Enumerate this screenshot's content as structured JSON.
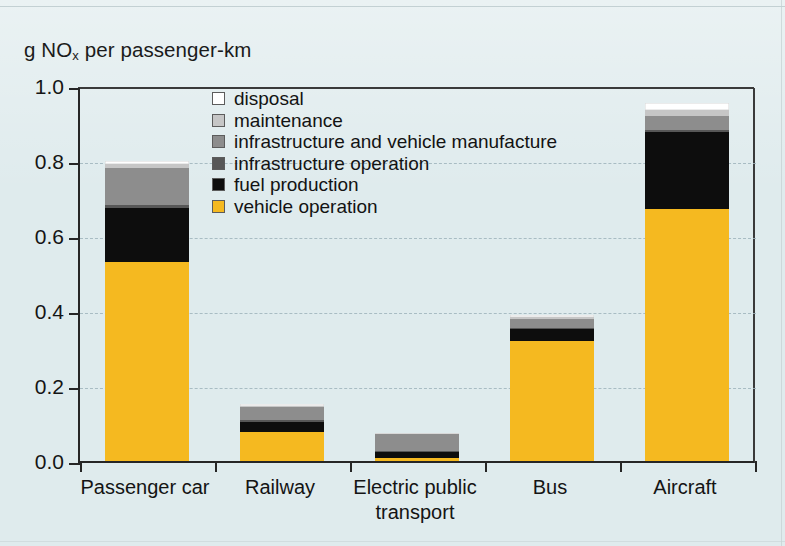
{
  "chart_data": {
    "type": "bar",
    "stacked": true,
    "title": "",
    "ylabel": "g NOx per passenger-km",
    "ylabel_html": "g NO<sub>x</sub> per passenger-km",
    "xlabel": "",
    "ylim": [
      0.0,
      1.0
    ],
    "yticks": [
      "1.0",
      "0.8",
      "0.6",
      "0.4",
      "0.2",
      "0.0"
    ],
    "ytick_values": [
      1.0,
      0.8,
      0.6,
      0.4,
      0.2,
      0.0
    ],
    "grid": "horizontal-dashed",
    "legend_position": "inside-top-left",
    "categories": [
      "Passenger car",
      "Railway",
      "Electric public transport",
      "Bus",
      "Aircraft"
    ],
    "category_lines": [
      [
        "Passenger car"
      ],
      [
        "Railway"
      ],
      [
        "Electric public",
        "transport"
      ],
      [
        "Bus"
      ],
      [
        "Aircraft"
      ]
    ],
    "series": [
      {
        "name": "vehicle operation",
        "color": "#f5b920",
        "values": [
          0.53,
          0.077,
          0.008,
          0.32,
          0.672
        ]
      },
      {
        "name": "fuel production",
        "color": "#0d0d0d",
        "values": [
          0.145,
          0.027,
          0.017,
          0.031,
          0.205
        ]
      },
      {
        "name": "infrastructure operation",
        "color": "#575757",
        "values": [
          0.007,
          0.005,
          0.003,
          0.004,
          0.006
        ]
      },
      {
        "name": "infrastructure and vehicle manufacture",
        "color": "#8d8d8d",
        "values": [
          0.1,
          0.035,
          0.043,
          0.025,
          0.037
        ]
      },
      {
        "name": "maintenance",
        "color": "#c6c6c6",
        "values": [
          0.01,
          0.004,
          0.002,
          0.005,
          0.016
        ]
      },
      {
        "name": "disposal",
        "color": "#ffffff",
        "values": [
          0.008,
          0.004,
          0.002,
          0.005,
          0.019
        ]
      }
    ],
    "totals": [
      0.8,
      0.152,
      0.075,
      0.39,
      0.955
    ]
  },
  "legend": {
    "items": [
      {
        "label": "disposal",
        "color": "#ffffff"
      },
      {
        "label": "maintenance",
        "color": "#c6c6c6"
      },
      {
        "label": "infrastructure and vehicle manufacture",
        "color": "#8d8d8d"
      },
      {
        "label": "infrastructure operation",
        "color": "#575757"
      },
      {
        "label": "fuel production",
        "color": "#0d0d0d"
      },
      {
        "label": "vehicle operation",
        "color": "#f5b920"
      }
    ]
  },
  "colors": {
    "background": "#dfebed",
    "axis": "#262626",
    "grid": "#9fb4bc",
    "text": "#141414"
  }
}
